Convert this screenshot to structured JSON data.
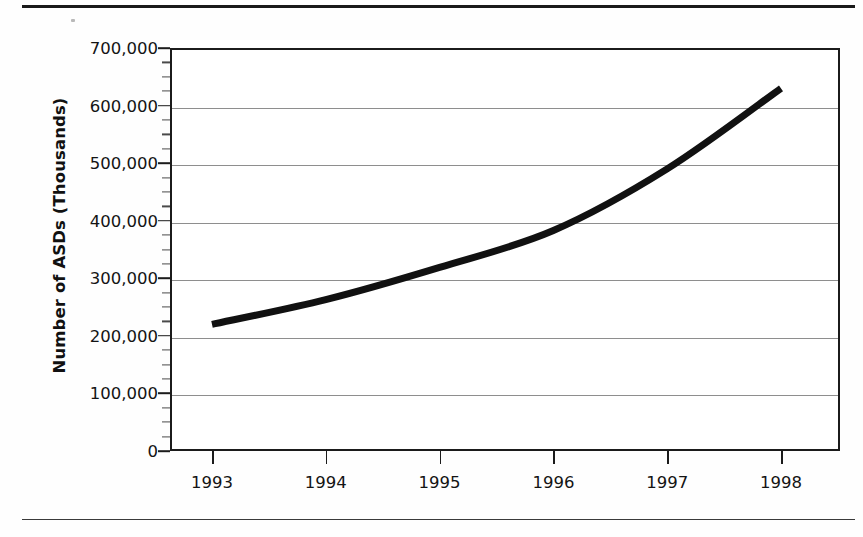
{
  "chart_data": {
    "type": "line",
    "title": "",
    "xlabel": "",
    "ylabel": "Number of ASDs (Thousands)",
    "categories": [
      "1993",
      "1994",
      "1995",
      "1996",
      "1997",
      "1998"
    ],
    "x": [
      1993,
      1994,
      1995,
      1996,
      1997,
      1998
    ],
    "values": [
      220000,
      263000,
      319000,
      383000,
      490000,
      630000
    ],
    "series": [
      {
        "name": "Number of ASDs",
        "values": [
          220000,
          263000,
          319000,
          383000,
          490000,
          630000
        ]
      }
    ],
    "ylim": [
      0,
      700000
    ],
    "ytick_values": [
      0,
      100000,
      200000,
      300000,
      400000,
      500000,
      600000,
      700000
    ],
    "ytick_labels": [
      "0",
      "100,000",
      "200,000",
      "300,000",
      "400,000",
      "500,000",
      "600,000",
      "700,000"
    ],
    "y_minor_tick_interval": 25000,
    "xtick_labels": [
      "1993",
      "1994",
      "1995",
      "1996",
      "1997",
      "1998"
    ],
    "grid": "horizontal",
    "legend": "none",
    "line_color": "#111111",
    "line_width_px": 7,
    "grid_color": "#8e8e8e",
    "frame_color": "#1b1b1b",
    "background_color": "#ffffff"
  },
  "figure": {
    "top_rule": "",
    "bottom_rule": "",
    "alt_text": "Line chart showing Number of ASDs (Thousands) rising from about 220,000 in 1993 to about 630,000 in 1998."
  }
}
